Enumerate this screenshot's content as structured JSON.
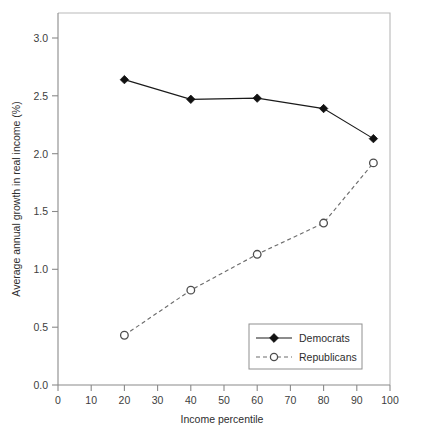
{
  "chart_data": {
    "type": "line",
    "title": "",
    "xlabel": "Income percentile",
    "ylabel": "Average annual growth in real income (%)",
    "xlim": [
      0,
      100
    ],
    "ylim": [
      0.0,
      3.0
    ],
    "xticks": [
      0,
      10,
      20,
      30,
      40,
      50,
      60,
      70,
      80,
      90,
      100
    ],
    "xtick_labels": [
      "0",
      "10",
      "20",
      "30",
      "40",
      "50",
      "60",
      "70",
      "80",
      "90",
      "100"
    ],
    "yticks": [
      0.0,
      0.5,
      1.0,
      1.5,
      2.0,
      2.5,
      3.0
    ],
    "ytick_labels": [
      "0.0",
      "0.5",
      "1.0",
      "1.5",
      "2.0",
      "2.5",
      "3.0"
    ],
    "grid": false,
    "legend_position": "lower-right-inside",
    "x": [
      20,
      40,
      60,
      80,
      95
    ],
    "series": [
      {
        "name": "Democrats",
        "values": [
          2.64,
          2.47,
          2.48,
          2.39,
          2.13
        ],
        "linestyle": "solid",
        "marker": "filled-diamond",
        "color": "#111111"
      },
      {
        "name": "Republicans",
        "values": [
          0.43,
          0.82,
          1.13,
          1.4,
          1.92
        ],
        "linestyle": "dashed",
        "marker": "open-circle",
        "color": "#6d6d6d"
      }
    ]
  },
  "legend": {
    "entries": [
      {
        "label": "Democrats"
      },
      {
        "label": "Republicans"
      }
    ]
  },
  "colors": {
    "democrats": "#111111",
    "republicans": "#6d6d6d",
    "axis": "#8a8a8a",
    "frame": "#b9b9b9",
    "background": "#ffffff"
  }
}
